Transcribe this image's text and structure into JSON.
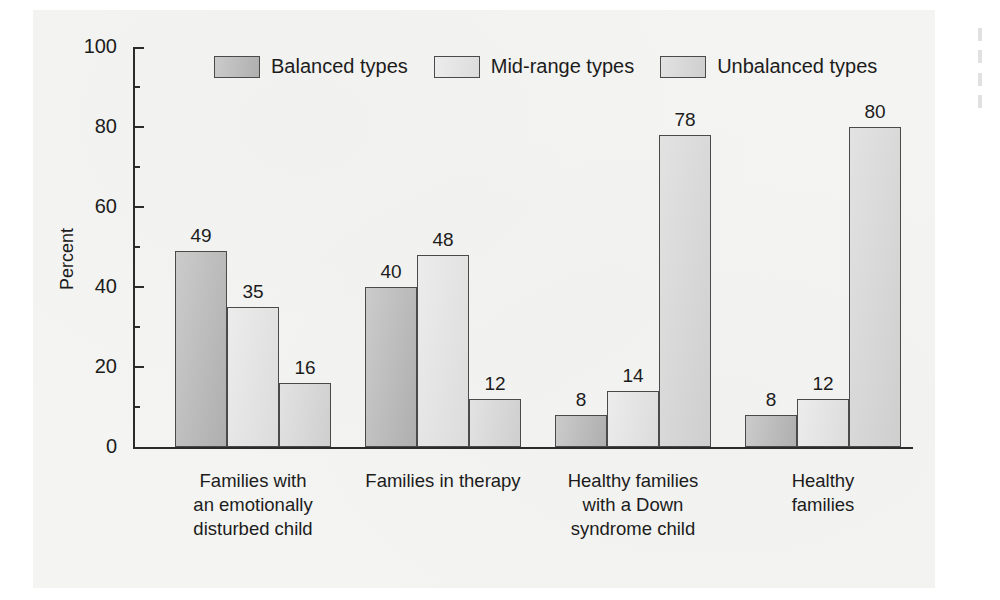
{
  "chart_data": {
    "type": "bar",
    "title": "",
    "xlabel": "",
    "ylabel": "Percent",
    "ylim": [
      0,
      100
    ],
    "ytick_values": [
      0,
      20,
      40,
      60,
      80,
      100
    ],
    "ytick_labels": [
      "0",
      "20",
      "40",
      "60",
      "80",
      "100"
    ],
    "yminor_step": 10,
    "grid": false,
    "legend_position": "top-center",
    "categories": [
      "Families with\nan emotionally\ndisturbed child",
      "Families in therapy",
      "Healthy families\nwith a Down\nsyndrome child",
      "Healthy families"
    ],
    "series": [
      {
        "name": "Balanced types",
        "color": "#b5b5b5",
        "values": [
          49,
          40,
          8,
          8
        ],
        "labels": [
          "49",
          "40",
          "8",
          "8"
        ]
      },
      {
        "name": "Mid-range types",
        "color": "#e4e4e4",
        "values": [
          35,
          48,
          14,
          12
        ],
        "labels": [
          "35",
          "48",
          "14",
          "12"
        ]
      },
      {
        "name": "Unbalanced types",
        "color": "#d6d6d6",
        "values": [
          16,
          12,
          78,
          80
        ],
        "labels": [
          "16",
          "12",
          "78",
          "80"
        ]
      }
    ]
  },
  "style": {
    "page_background": "#ffffff",
    "panel_background": "#f4f4f2",
    "axis_color": "#2b2b2b",
    "bar_outline": "#4a4a4a",
    "text_color": "#1c1c1c"
  },
  "artifacts": {
    "edge_marks": [
      "mark-1",
      "mark-2",
      "mark-3",
      "mark-4"
    ]
  }
}
